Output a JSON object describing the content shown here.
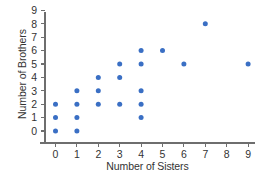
{
  "chart_data": {
    "type": "scatter",
    "title": "",
    "xlabel": "Number of Sisters",
    "ylabel": "Number of Brothers",
    "xlim": [
      -0.5,
      9.6
    ],
    "ylim": [
      -0.6,
      9.4
    ],
    "xticks": [
      "0",
      "1",
      "2",
      "3",
      "4",
      "5",
      "6",
      "7",
      "8",
      "9"
    ],
    "yticks": [
      "0",
      "1",
      "2",
      "3",
      "4",
      "5",
      "6",
      "7",
      "8",
      "9"
    ],
    "grid": false,
    "legend": null,
    "marker_color": "#3a6fc4",
    "axis_color": "#6e6e6e",
    "points": [
      {
        "x": 0,
        "y": 0
      },
      {
        "x": 0,
        "y": 1
      },
      {
        "x": 0,
        "y": 2
      },
      {
        "x": 1,
        "y": 0
      },
      {
        "x": 1,
        "y": 1
      },
      {
        "x": 1,
        "y": 2
      },
      {
        "x": 1,
        "y": 3
      },
      {
        "x": 2,
        "y": 2
      },
      {
        "x": 2,
        "y": 3
      },
      {
        "x": 2,
        "y": 4
      },
      {
        "x": 3,
        "y": 2
      },
      {
        "x": 3,
        "y": 4
      },
      {
        "x": 3,
        "y": 5
      },
      {
        "x": 4,
        "y": 1
      },
      {
        "x": 4,
        "y": 2
      },
      {
        "x": 4,
        "y": 3
      },
      {
        "x": 4,
        "y": 5
      },
      {
        "x": 4,
        "y": 6
      },
      {
        "x": 5,
        "y": 6
      },
      {
        "x": 6,
        "y": 5
      },
      {
        "x": 7,
        "y": 8
      },
      {
        "x": 9,
        "y": 5
      }
    ]
  }
}
